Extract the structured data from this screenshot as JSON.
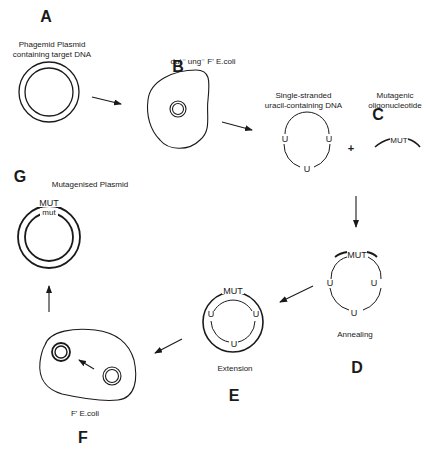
{
  "diagram": {
    "steps": {
      "A": {
        "letter": "A",
        "caption_line1": "Phagemid Plasmid",
        "caption_line2": "containing target DNA"
      },
      "B": {
        "letter": "B",
        "caption": "dut⁻ ung⁻ F' E.coli"
      },
      "C": {
        "letter": "C",
        "caption_line1": "Single-stranded",
        "caption_line2": "uracil-containing DNA",
        "oligo_caption_line1": "Mutagenic",
        "oligo_caption_line2": "oligonucleotide",
        "plus": "+"
      },
      "D": {
        "letter": "D",
        "caption": "Annealing"
      },
      "E": {
        "letter": "E",
        "caption": "Extension"
      },
      "F": {
        "letter": "F",
        "caption": "F' E.coli"
      },
      "G": {
        "letter": "G",
        "caption": "Mutagenised Plasmid"
      }
    },
    "markers": {
      "uracil": "U",
      "mutation": "MUT",
      "mutation_lower": "mut"
    },
    "colors": {
      "line": "#1a1a1a",
      "background": "#ffffff"
    }
  }
}
